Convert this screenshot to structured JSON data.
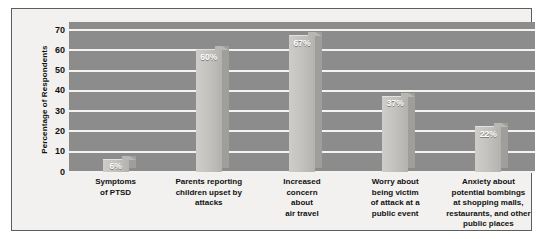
{
  "chart_data": {
    "type": "bar",
    "title": "",
    "subtitle": "",
    "xlabel": "",
    "ylabel": "Percentage of Respondents",
    "ylim": [
      0,
      70
    ],
    "ytick_step": 10,
    "yticks": [
      "70",
      "60",
      "50",
      "40",
      "30",
      "20",
      "10",
      "0"
    ],
    "grid": true,
    "legend": false,
    "categories": [
      "Symptoms\nof PTSD",
      "Parents reporting\nchildren upset by\nattacks",
      "Increased\nconcern\nabout\nair travel",
      "Worry about\nbeing victim\nof attack at a\npublic event",
      "Anxiety about\npotential bombings\nat shopping malls,\nrestaurants, and other\npublic places"
    ],
    "category_lines": [
      [
        "Symptoms",
        "of PTSD"
      ],
      [
        "Parents reporting",
        "children upset by",
        "attacks"
      ],
      [
        "Increased",
        "concern",
        "about",
        "air travel"
      ],
      [
        "Worry about",
        "being victim",
        "of attack at a",
        "public event"
      ],
      [
        "Anxiety about",
        "potential bombings",
        "at shopping malls,",
        "restaurants, and other",
        "public places"
      ]
    ],
    "values": [
      6,
      60,
      67,
      37,
      22
    ],
    "value_labels": [
      "6%",
      "60%",
      "67%",
      "37%",
      "22%"
    ],
    "colors": {
      "plot_background": "#8c8c8c",
      "gridline": "#f4f3f1",
      "bar_face": "#c5c3bf",
      "bar_side": "#a09e9a",
      "value_label": "#ffffff",
      "axis_text": "#111111",
      "figure_background": "#f2f1ef",
      "frame_border": "#5d5d5d"
    }
  }
}
